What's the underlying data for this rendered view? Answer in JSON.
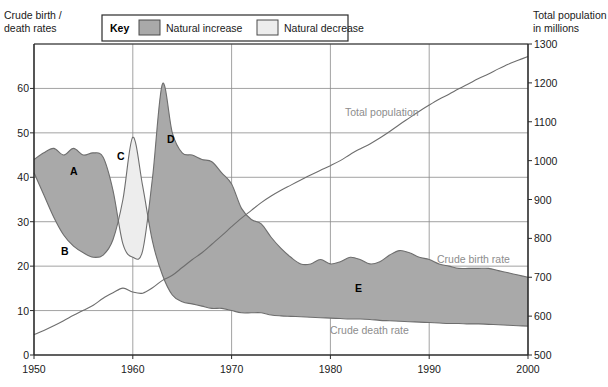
{
  "legend": {
    "title": "Key",
    "entries": [
      {
        "label": "Natural increase",
        "color": "#a9a9a9"
      },
      {
        "label": "Natural decrease",
        "color": "#ededed"
      }
    ]
  },
  "left_axis": {
    "title_line1": "Crude birth /",
    "title_line2": "death rates",
    "ticks": [
      "60",
      "50",
      "40",
      "30",
      "20",
      "10",
      "0"
    ]
  },
  "right_axis": {
    "title_line1": "Total population",
    "title_line2": "in millions",
    "ticks": [
      "1300",
      "1200",
      "1100",
      "1000",
      "900",
      "800",
      "700",
      "600",
      "500"
    ]
  },
  "x_axis": {
    "ticks": [
      "1950",
      "1960",
      "1970",
      "1980",
      "1990",
      "2000"
    ]
  },
  "series_labels": {
    "total_population": "Total population",
    "crude_birth_rate": "Crude birth rate",
    "crude_death_rate": "Crude death rate"
  },
  "annotations": [
    {
      "id": "A",
      "label": "A"
    },
    {
      "id": "B",
      "label": "B"
    },
    {
      "id": "C",
      "label": "C"
    },
    {
      "id": "D",
      "label": "D"
    },
    {
      "id": "E",
      "label": "E"
    }
  ],
  "colors": {
    "natural_increase": "#a9a9a9",
    "natural_decrease": "#ededed",
    "line": "#6e6e6e",
    "grid": "#8a8a8a",
    "axis": "#2b2b2b",
    "label_gray": "#8d8d8d"
  },
  "chart_data": {
    "type": "area",
    "xlabel": "",
    "ylabel": "Crude birth / death rates",
    "y2label": "Total population in millions",
    "xlim": [
      1950,
      2000
    ],
    "ylim": [
      0,
      70
    ],
    "y2lim": [
      500,
      1300
    ],
    "grid": true,
    "legend_position": "top-center",
    "x": [
      1950,
      1951,
      1952,
      1953,
      1954,
      1955,
      1956,
      1957,
      1958,
      1959,
      1960,
      1961,
      1962,
      1963,
      1964,
      1965,
      1966,
      1967,
      1968,
      1969,
      1970,
      1971,
      1972,
      1973,
      1974,
      1975,
      1976,
      1977,
      1978,
      1979,
      1980,
      1981,
      1982,
      1983,
      1984,
      1985,
      1986,
      1987,
      1988,
      1989,
      1990,
      1991,
      1992,
      1993,
      1994,
      1995,
      1996,
      1997,
      1998,
      1999,
      2000
    ],
    "series": [
      {
        "name": "Crude birth rate",
        "unit": "per 1000",
        "axis": "left",
        "values": [
          44.0,
          45.5,
          46.5,
          45.0,
          46.5,
          45.0,
          45.5,
          44.5,
          37.0,
          25.0,
          22.0,
          23.5,
          40.0,
          61.0,
          50.0,
          45.5,
          45.0,
          44.0,
          43.5,
          41.0,
          38.5,
          33.0,
          30.5,
          29.5,
          26.5,
          24.0,
          22.0,
          20.5,
          20.5,
          21.5,
          20.5,
          21.0,
          22.0,
          21.5,
          20.5,
          21.0,
          22.5,
          23.5,
          23.0,
          22.0,
          21.5,
          20.5,
          20.0,
          19.5,
          19.5,
          19.5,
          19.5,
          19.0,
          18.5,
          18.0,
          17.5
        ]
      },
      {
        "name": "Crude death rate",
        "unit": "per 1000",
        "axis": "left",
        "values": [
          41.0,
          36.0,
          31.0,
          27.0,
          24.5,
          23.0,
          22.0,
          22.5,
          26.0,
          35.0,
          49.0,
          38.0,
          25.5,
          18.0,
          13.5,
          12.0,
          11.5,
          11.0,
          10.5,
          10.5,
          10.0,
          9.5,
          9.5,
          9.5,
          9.0,
          8.8,
          8.7,
          8.6,
          8.5,
          8.4,
          8.3,
          8.2,
          8.1,
          8.1,
          8.0,
          7.8,
          7.7,
          7.6,
          7.5,
          7.4,
          7.3,
          7.2,
          7.1,
          7.1,
          7.0,
          7.0,
          6.9,
          6.8,
          6.7,
          6.6,
          6.5
        ]
      },
      {
        "name": "Total population",
        "unit": "millions",
        "axis": "right",
        "values": [
          552,
          563,
          575,
          588,
          602,
          615,
          628,
          646,
          660,
          672,
          662,
          659,
          673,
          692,
          705,
          725,
          745,
          763,
          785,
          807,
          830,
          852,
          872,
          892,
          909,
          924,
          937,
          950,
          963,
          975,
          987,
          1000,
          1016,
          1030,
          1043,
          1058,
          1075,
          1093,
          1110,
          1127,
          1143,
          1158,
          1171,
          1185,
          1198,
          1211,
          1223,
          1236,
          1248,
          1258,
          1268
        ]
      }
    ],
    "regions": [
      {
        "type": "natural_increase",
        "description": "Birth rate above death rate (shaded mid-gray)",
        "ranges": [
          [
            1950,
            1958
          ],
          [
            1962,
            2000
          ]
        ]
      },
      {
        "type": "natural_decrease",
        "description": "Death rate above birth rate (shaded light gray) — Great Leap Forward famine",
        "ranges": [
          [
            1958,
            1962
          ]
        ]
      }
    ],
    "annotations": [
      {
        "label": "A",
        "x": 1952,
        "y": 46.5,
        "description": "Early high birth rate"
      },
      {
        "label": "B",
        "x": 1955,
        "y": 23.0,
        "description": "Falling death rate"
      },
      {
        "label": "C",
        "x": 1960,
        "y": 49.0,
        "description": "Death rate peak, natural decrease"
      },
      {
        "label": "D",
        "x": 1963,
        "y": 61.0,
        "description": "Post-famine birth rate peak"
      },
      {
        "label": "E",
        "x": 1981,
        "y": 21.0,
        "description": "Birth rate after one-child policy"
      }
    ]
  }
}
